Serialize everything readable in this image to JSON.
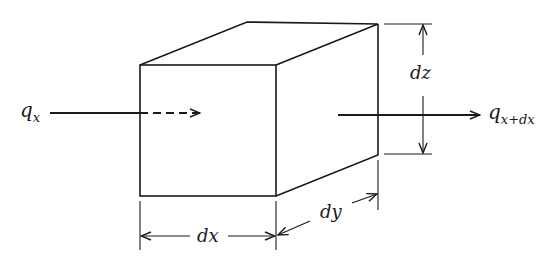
{
  "diagram": {
    "type": "control-volume-box",
    "labels": {
      "q_in_main": "q",
      "q_in_sub": "x",
      "q_out_main": "q",
      "q_out_sub": "x+dx",
      "dx": "dx",
      "dy": "dy",
      "dz": "dz"
    },
    "colors": {
      "stroke": "#1a1a1a",
      "background": "#ffffff"
    }
  }
}
